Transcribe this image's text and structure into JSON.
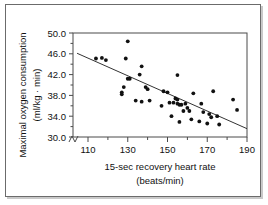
{
  "chart_data": {
    "type": "scatter",
    "title": "",
    "xlabel": "15-sec recovery heart rate (beats/min)",
    "xlabel_line1": "15-sec recovery heart rate",
    "xlabel_line2": "(beats/min)",
    "ylabel": "Maximal oxygen consumption (ml/kg · min)",
    "ylabel_line1": "Maximal oxygen consumption",
    "ylabel_line2": "(ml/kg · min)",
    "xlim": [
      102,
      190
    ],
    "ylim": [
      28.4,
      50.0
    ],
    "xticks": [
      110,
      130,
      150,
      170,
      190
    ],
    "xtick_labels": [
      "110",
      "130",
      "150",
      "170",
      "190"
    ],
    "xticks_minor": [
      120,
      140,
      160,
      180
    ],
    "yticks": [
      30.0,
      34.0,
      38.0,
      42.0,
      46.0,
      50.0
    ],
    "ytick_labels": [
      "30.0",
      "34.0",
      "38.0",
      "42.0",
      "46.0",
      "50.0"
    ],
    "grid": false,
    "legend": false,
    "axis_break_x": true,
    "marker_color": "#111111",
    "line_color": "#333333",
    "points": [
      [
        114,
        45.1
      ],
      [
        117,
        45.2
      ],
      [
        119,
        44.8
      ],
      [
        127,
        38.6
      ],
      [
        127,
        38.2
      ],
      [
        128,
        39.6
      ],
      [
        129,
        45.1
      ],
      [
        130,
        48.4
      ],
      [
        130,
        41.2
      ],
      [
        131,
        41.2
      ],
      [
        134,
        37.0
      ],
      [
        136,
        42.0
      ],
      [
        137,
        43.6
      ],
      [
        137,
        36.8
      ],
      [
        139,
        39.6
      ],
      [
        140,
        39.2
      ],
      [
        141,
        37.0
      ],
      [
        147,
        36.0
      ],
      [
        148,
        38.8
      ],
      [
        150,
        38.6
      ],
      [
        151,
        36.6
      ],
      [
        152,
        34.0
      ],
      [
        153,
        36.6
      ],
      [
        154,
        37.4
      ],
      [
        155,
        37.2
      ],
      [
        155,
        36.4
      ],
      [
        155,
        41.9
      ],
      [
        156,
        36.2
      ],
      [
        156,
        32.9
      ],
      [
        157,
        36.2
      ],
      [
        158,
        35.0
      ],
      [
        159,
        36.4
      ],
      [
        160,
        35.6
      ],
      [
        161,
        35.0
      ],
      [
        162,
        33.4
      ],
      [
        163,
        38.4
      ],
      [
        166,
        33.0
      ],
      [
        167,
        36.4
      ],
      [
        168,
        34.8
      ],
      [
        170,
        32.6
      ],
      [
        171,
        34.4
      ],
      [
        172,
        33.8
      ],
      [
        173,
        38.8
      ],
      [
        175,
        34.0
      ],
      [
        176,
        32.4
      ],
      [
        183,
        37.2
      ],
      [
        185,
        35.2
      ]
    ],
    "fit_line": {
      "x_start": 104.5,
      "y_start": 46.1,
      "x_end": 190.0,
      "y_end": 31.6,
      "description": "least-squares regression line, negative slope"
    }
  }
}
